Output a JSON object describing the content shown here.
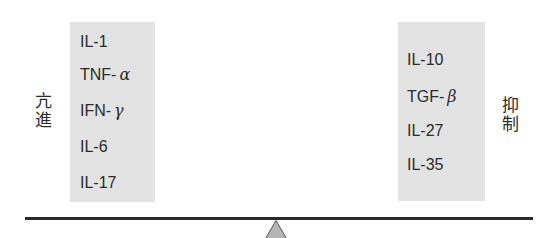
{
  "diagram": {
    "type": "balance-seesaw",
    "left": {
      "label_chars": [
        "亢",
        "進"
      ],
      "label": "亢進",
      "items": [
        {
          "base": "IL-1",
          "greek": ""
        },
        {
          "base": "TNF-",
          "greek": "α"
        },
        {
          "base": "IFN-",
          "greek": "γ"
        },
        {
          "base": "IL-6",
          "greek": ""
        },
        {
          "base": "IL-17",
          "greek": ""
        }
      ]
    },
    "right": {
      "label_chars": [
        "抑",
        "制"
      ],
      "label": "抑制",
      "items": [
        {
          "base": "IL-10",
          "greek": ""
        },
        {
          "base": "TGF-",
          "greek": "β"
        },
        {
          "base": "IL-27",
          "greek": ""
        },
        {
          "base": "IL-35",
          "greek": ""
        }
      ]
    },
    "colors": {
      "box_fill": "#e3e3e3",
      "text": "#2b2b2b",
      "beam": "#2a2a2a",
      "fulcrum_fill": "#b5b5b5",
      "fulcrum_stroke": "#555555"
    }
  }
}
